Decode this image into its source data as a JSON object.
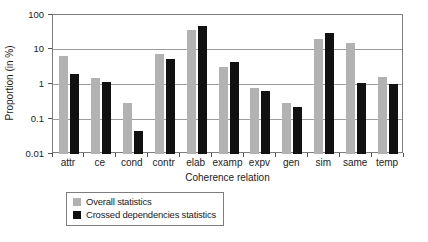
{
  "chart_data": {
    "type": "bar",
    "scale": "log",
    "title": "",
    "xlabel": "Coherence relation",
    "ylabel": "Proportion (in %)",
    "ylim": [
      0.01,
      100
    ],
    "ytick_labels": [
      "100",
      "10",
      "1",
      "0.1",
      "0.01"
    ],
    "grid": true,
    "legend_position": "bottom-left",
    "categories": [
      "attr",
      "ce",
      "cond",
      "contr",
      "elab",
      "examp",
      "expv",
      "gen",
      "sim",
      "same",
      "temp"
    ],
    "series": [
      {
        "name": "Overall statistics",
        "color": "#b2b2b2",
        "values": [
          6.5,
          1.5,
          0.3,
          7.5,
          38,
          3.2,
          0.8,
          0.3,
          21,
          15.5,
          1.6
        ]
      },
      {
        "name": "Crossed dependencies statistics",
        "color": "#111111",
        "values": [
          2.0,
          1.15,
          0.045,
          5.5,
          48,
          4.5,
          0.65,
          0.22,
          30,
          1.1,
          1.05
        ]
      }
    ],
    "colors": {
      "gridline": "#9c9c9c",
      "frame": "#7d7d7d",
      "text": "#1c1c1c"
    }
  }
}
